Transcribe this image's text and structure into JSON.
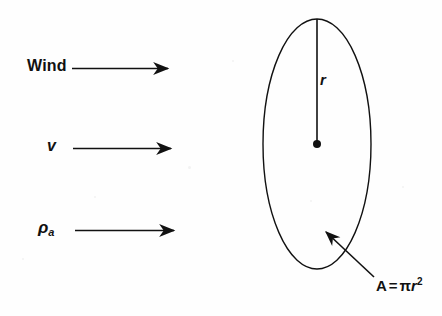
{
  "figure": {
    "stroke_color": "#111111",
    "background_color": "#fefefe"
  },
  "flow_labels": [
    {
      "id": "wind",
      "text": "Wind"
    },
    {
      "id": "velocity",
      "text": "v"
    },
    {
      "id": "air-density",
      "symbol": "ρ",
      "subscript": "a"
    }
  ],
  "arrows": [
    {
      "id": "wind-arrow",
      "x1": 72,
      "y1": 68,
      "x2": 173,
      "y2": 68
    },
    {
      "id": "velocity-arrow",
      "x1": 73,
      "y1": 148,
      "x2": 176,
      "y2": 148
    },
    {
      "id": "density-arrow",
      "x1": 75,
      "y1": 230,
      "x2": 179,
      "y2": 230
    }
  ],
  "disc": {
    "center_x": 317,
    "center_y": 144,
    "radius_x": 54,
    "radius_y": 125,
    "radius_label": "r",
    "center_dot_radius": 4
  },
  "area_callout": {
    "label_A": "A",
    "equals": "=",
    "pi": "π",
    "variable": "r",
    "exponent": "2",
    "arrow": {
      "tail_x": 374,
      "tail_y": 277,
      "tip_x": 321,
      "tip_y": 227
    }
  }
}
